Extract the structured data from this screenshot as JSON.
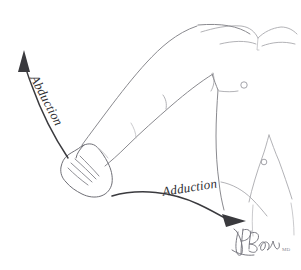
{
  "figure": {
    "background_color": "#ffffff",
    "width": 301,
    "height": 270,
    "line_color": "#8a8a8f",
    "arrow_color": "#3a3a3e"
  },
  "annotations": {
    "abduction": {
      "label": "Abduction",
      "direction": "upward",
      "rotation_degrees": 62,
      "x": 30,
      "y": 78
    },
    "adduction": {
      "label": "Adduction",
      "direction": "rightward",
      "rotation_degrees": -9,
      "x": 163,
      "y": 196
    }
  },
  "anatomy": {
    "parts": [
      "clavicle",
      "sternal-notch",
      "shoulder",
      "upper-arm",
      "elbow",
      "forearm",
      "wrist",
      "hand",
      "torso",
      "nipple",
      "rib-cage",
      "abdomen",
      "navel"
    ]
  },
  "signature": {
    "name": "Brady",
    "credential": "MD"
  }
}
